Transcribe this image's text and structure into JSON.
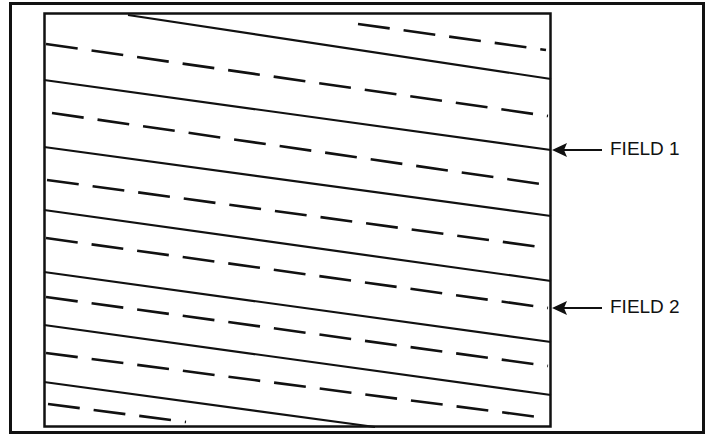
{
  "diagram": {
    "colors": {
      "background": "#ffffff",
      "ink": "#111111"
    },
    "outer_frame": {
      "x": 9,
      "y": 2,
      "width": 695,
      "height": 432
    },
    "inner_box": {
      "x": 44,
      "y": 13,
      "width": 507,
      "height": 414
    },
    "tracks": {
      "solid": [
        {
          "x1": 128,
          "y1": 15,
          "x2": 551,
          "y2": 79
        },
        {
          "x1": 44,
          "y1": 80,
          "x2": 551,
          "y2": 150
        },
        {
          "x1": 44,
          "y1": 147,
          "x2": 551,
          "y2": 216
        },
        {
          "x1": 44,
          "y1": 210,
          "x2": 551,
          "y2": 281
        },
        {
          "x1": 44,
          "y1": 272,
          "x2": 551,
          "y2": 342
        },
        {
          "x1": 44,
          "y1": 325,
          "x2": 551,
          "y2": 395
        },
        {
          "x1": 44,
          "y1": 382,
          "x2": 375,
          "y2": 427
        }
      ],
      "dashed": [
        {
          "x1": 358,
          "y1": 24,
          "x2": 546,
          "y2": 50
        },
        {
          "x1": 46,
          "y1": 44,
          "x2": 548,
          "y2": 116
        },
        {
          "x1": 52,
          "y1": 113,
          "x2": 548,
          "y2": 185
        },
        {
          "x1": 47,
          "y1": 180,
          "x2": 548,
          "y2": 248
        },
        {
          "x1": 46,
          "y1": 238,
          "x2": 548,
          "y2": 308
        },
        {
          "x1": 46,
          "y1": 297,
          "x2": 548,
          "y2": 366
        },
        {
          "x1": 46,
          "y1": 353,
          "x2": 546,
          "y2": 418
        },
        {
          "x1": 48,
          "y1": 404,
          "x2": 186,
          "y2": 422
        }
      ]
    },
    "annotations": [
      {
        "id": "field-1",
        "label": "FIELD 1",
        "arrow_tip_x": 552,
        "arrow_y": 150,
        "arrow_tail_x": 602,
        "label_x": 610,
        "label_y": 140
      },
      {
        "id": "field-2",
        "label": "FIELD 2",
        "arrow_tip_x": 552,
        "arrow_y": 308,
        "arrow_tail_x": 602,
        "label_x": 610,
        "label_y": 298
      }
    ]
  }
}
